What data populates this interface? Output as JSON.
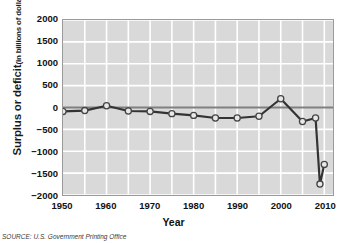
{
  "figure": {
    "source_note": "SOURCE: U.S. Government Printing Office"
  },
  "chart_data": {
    "type": "line",
    "title": "",
    "xlabel": "Year",
    "ylabel": "Surplus or deficit",
    "ylabel_main": "Surplus or deficit",
    "ylabel_units": "(in billions of dollars)",
    "xlim": [
      1950,
      2012
    ],
    "ylim": [
      -2000,
      2000
    ],
    "yticks": [
      2000,
      1500,
      1000,
      500,
      0,
      -500,
      -1000,
      -1500,
      -2000
    ],
    "ytick_labels": [
      "2000",
      "1500",
      "1000",
      "500",
      "0",
      "−500",
      "−1000",
      "−1500",
      "−2000"
    ],
    "xticks": [
      1950,
      1960,
      1970,
      1980,
      1990,
      2000,
      2010
    ],
    "xtick_labels": [
      "1950",
      "1960",
      "1970",
      "1980",
      "1990",
      "2000",
      "2010"
    ],
    "x_minor_step": 5,
    "grid": true,
    "grid_color": "#ffffff",
    "plot_bgcolor": "#d9d9d9",
    "line_color": "#333333",
    "marker_face_color": "#e8e8e8",
    "marker_edge_color": "#444444",
    "zero_line": true,
    "zero_line_color": "#808080",
    "legend": "none",
    "x": [
      1950,
      1955,
      1960,
      1965,
      1970,
      1975,
      1980,
      1985,
      1990,
      1995,
      2000,
      2005,
      2008,
      2009,
      2010
    ],
    "values": [
      -90,
      -70,
      40,
      -80,
      -90,
      -140,
      -180,
      -240,
      -240,
      -200,
      200,
      -320,
      -240,
      -1750,
      -1300
    ],
    "series": [
      {
        "name": "Federal surplus or deficit",
        "values": [
          -90,
          -70,
          40,
          -80,
          -90,
          -140,
          -180,
          -240,
          -240,
          -200,
          200,
          -320,
          -240,
          -1750,
          -1300
        ]
      }
    ]
  }
}
